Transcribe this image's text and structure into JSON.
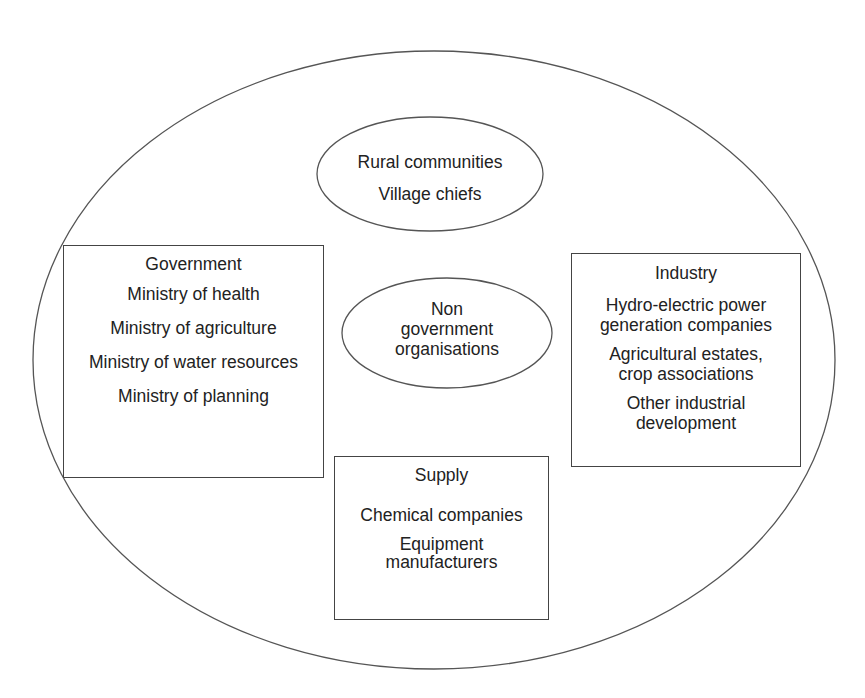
{
  "diagram": {
    "type": "stakeholder-map",
    "outer_boundary": {
      "shape": "ellipse"
    },
    "rural": {
      "shape": "ellipse",
      "items": [
        "Rural communities",
        "Village chiefs"
      ]
    },
    "ngo": {
      "shape": "ellipse",
      "lines": [
        "Non",
        "government",
        "organisations"
      ]
    },
    "government": {
      "shape": "box",
      "title": "Government",
      "items": [
        "Ministry of health",
        "Ministry of agriculture",
        "Ministry of water resources",
        "Ministry of planning"
      ]
    },
    "industry": {
      "shape": "box",
      "title": "Industry",
      "items": [
        [
          "Hydro-electric power",
          "generation companies"
        ],
        [
          "Agricultural estates,",
          "crop associations"
        ],
        [
          "Other industrial",
          "development"
        ]
      ]
    },
    "supply": {
      "shape": "box",
      "title": "Supply",
      "items": [
        [
          "Chemical companies"
        ],
        [
          "Equipment",
          "manufacturers"
        ]
      ]
    },
    "colors": {
      "stroke": "#444444",
      "text": "#222222",
      "background": "#ffffff"
    }
  }
}
